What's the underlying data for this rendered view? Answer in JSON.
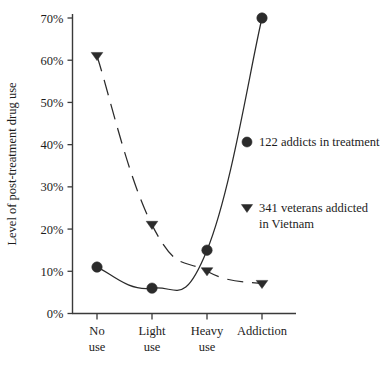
{
  "chart_data": {
    "type": "line",
    "title": "",
    "xlabel": "",
    "ylabel": "Level of post-treatment drug use",
    "categories": [
      "No use",
      "Light use",
      "Heavy use",
      "Addiction"
    ],
    "category_lines": [
      [
        "No",
        "use"
      ],
      [
        "Light",
        "use"
      ],
      [
        "Heavy",
        "use"
      ],
      [
        "Addiction"
      ]
    ],
    "ylim": [
      0,
      70
    ],
    "ytick_values": [
      0,
      10,
      20,
      30,
      40,
      50,
      60,
      70
    ],
    "ytick_labels": [
      "0%",
      "10%",
      "20%",
      "30%",
      "40%",
      "50%",
      "60%",
      "70%"
    ],
    "grid": false,
    "legend_position": "right-middle",
    "series": [
      {
        "name": "122 addicts in treatment",
        "marker": "circle",
        "line_style": "solid",
        "color": "#2b2b2b",
        "values": [
          11,
          6,
          15,
          70
        ]
      },
      {
        "name": "341 veterans addicted in Vietnam",
        "marker": "triangle-down",
        "line_style": "dashed",
        "color": "#2b2b2b",
        "values": [
          61,
          21,
          10,
          7
        ]
      }
    ]
  },
  "legend": {
    "entries": [
      {
        "marker": "circle",
        "label": "122 addicts in treatment",
        "label_lines": [
          "122 addicts in treatment"
        ]
      },
      {
        "marker": "triangle-down",
        "label": "341 veterans addicted in Vietnam",
        "label_lines": [
          "341 veterans addicted",
          "in Vietnam"
        ]
      }
    ]
  },
  "axes": {
    "y_title": "Level of post-treatment drug use",
    "y_ticks": [
      "70%",
      "60%",
      "50%",
      "40%",
      "30%",
      "20%",
      "10%",
      "0%"
    ],
    "x_ticks": [
      "No use",
      "Light use",
      "Heavy use",
      "Addiction"
    ]
  },
  "colors": {
    "ink": "#1c1c1c",
    "marker": "#2b2b2b",
    "axis": "#3a3a3a",
    "background": "#ffffff"
  }
}
